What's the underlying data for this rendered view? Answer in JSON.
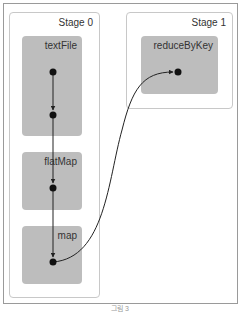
{
  "diagram": {
    "type": "spark-dag",
    "stages": [
      {
        "label": "Stage 0",
        "operations": [
          {
            "label": "textFile"
          },
          {
            "label": "flatMap"
          },
          {
            "label": "map"
          }
        ]
      },
      {
        "label": "Stage 1",
        "operations": [
          {
            "label": "reduceByKey"
          }
        ]
      }
    ],
    "edges": [
      {
        "from": "textFile.node0",
        "to": "textFile.node1",
        "style": "straight-arrow"
      },
      {
        "from": "textFile.node1",
        "to": "flatMap.node0",
        "style": "straight-arrow"
      },
      {
        "from": "flatMap.node0",
        "to": "map.node0",
        "style": "straight-arrow"
      },
      {
        "from": "map.node0",
        "to": "reduceByKey.node0",
        "style": "curved-arrow"
      }
    ],
    "colors": {
      "operation_box": "#bdbdbd",
      "stage_border": "#c8c8c8",
      "frame_border": "#9a9a9a",
      "edge": "#222222"
    }
  },
  "caption": "그림 3"
}
